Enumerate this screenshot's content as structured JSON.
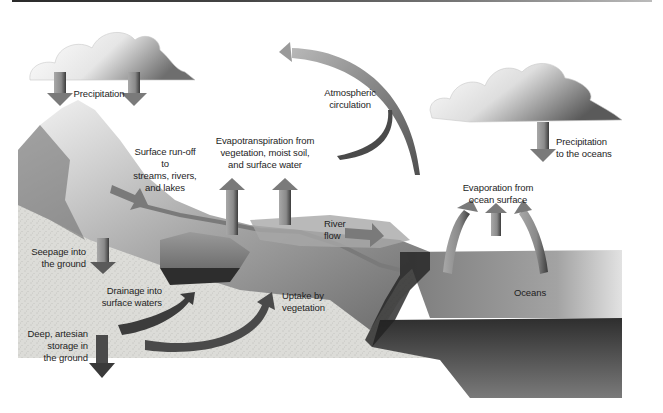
{
  "diagram": {
    "colors": {
      "arrow": "#8a8a8a",
      "arrow_dark": "#3c3c3c",
      "land_stipple": "#dcdcd8",
      "ocean_top": "#9a9a9a",
      "ocean_front": "#5e5e5e",
      "mountain": "#b8b8b8",
      "cloud": "#f2f2f2"
    },
    "labels": {
      "precipitation": "Precipitation",
      "surface_runoff": "Surface run-off to\nstreams, rivers,\nand lakes",
      "evapotranspiration": "Evapotranspiration from\nvegetation, moist soil,\nand surface water",
      "atmospheric_circulation": "Atmospheric\ncirculation",
      "precipitation_oceans": "Precipitation\nto the oceans",
      "evaporation_ocean": "Evaporation from\nocean surface",
      "river_flow": "River\nflow",
      "seepage": "Seepage into\nthe ground",
      "drainage": "Drainage into\nsurface waters",
      "uptake": "Uptake by\nvegetation",
      "deep_storage": "Deep, artesian\nstorage in\nthe ground",
      "oceans": "Oceans"
    }
  }
}
